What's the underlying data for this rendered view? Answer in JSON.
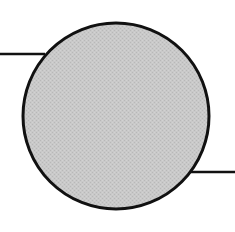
{
  "diagram": {
    "background": "#ffffff",
    "node": {
      "shape": "circle",
      "cx": 116,
      "cy": 116,
      "r": 93,
      "fill": "#c6c6c6",
      "stroke": "#111111",
      "stroke_width": 3,
      "texture": "halftone"
    },
    "connectors": [
      {
        "side": "left",
        "x1": 0,
        "y1": 54,
        "x2": 45,
        "y2": 54,
        "stroke": "#111111",
        "stroke_width": 2.5
      },
      {
        "side": "right",
        "x1": 189,
        "y1": 172,
        "x2": 235,
        "y2": 172,
        "stroke": "#111111",
        "stroke_width": 2.5
      }
    ]
  }
}
